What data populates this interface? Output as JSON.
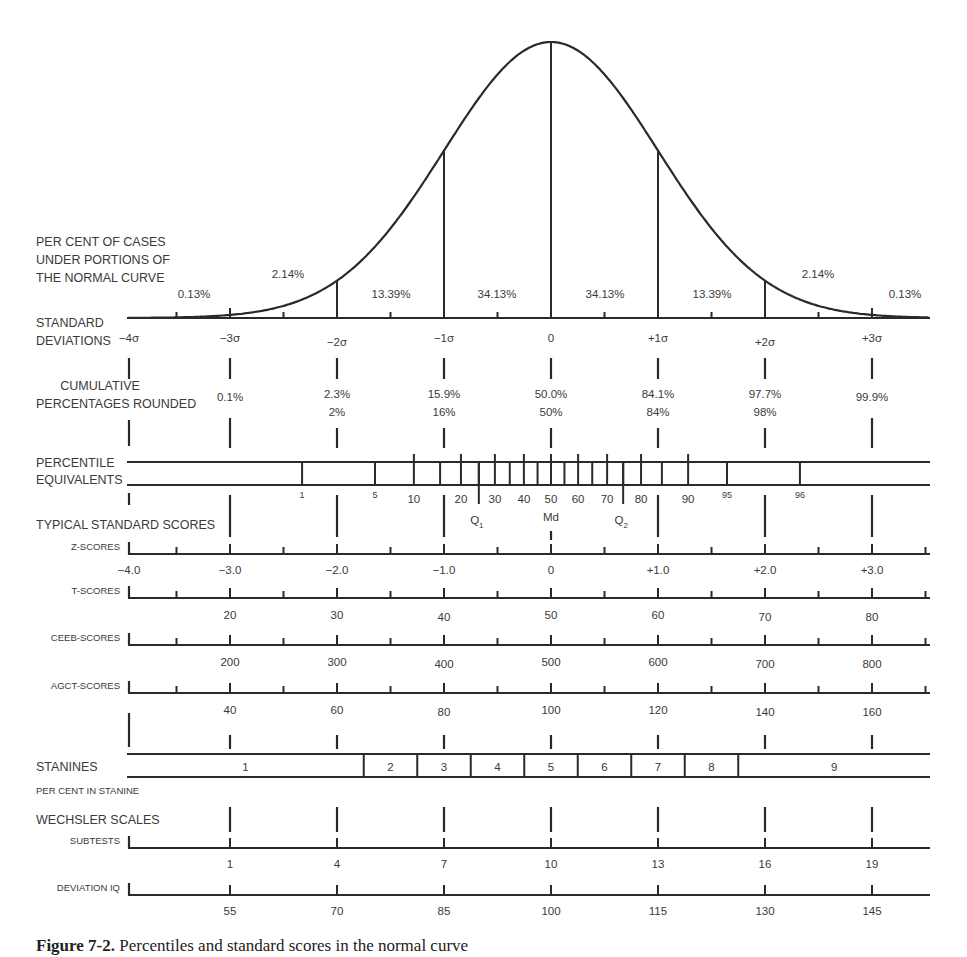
{
  "chart_data": {
    "type": "line",
    "curve": {
      "label_lines": [
        "PER CENT OF CASES",
        "UNDER PORTIONS OF",
        "THE NORMAL CURVE"
      ],
      "segment_percents": [
        "0.13%",
        "2.14%",
        "13.39%",
        "34.13%",
        "34.13%",
        "13.39%",
        "2.14%",
        "0.13%"
      ],
      "x_range_sigma": [
        -4,
        4
      ]
    },
    "standard_deviations": {
      "label_lines": [
        "STANDARD",
        "DEVIATIONS"
      ],
      "ticks": [
        "−4σ",
        "−3σ",
        "−2σ",
        "−1σ",
        "0",
        "+1σ",
        "+2σ",
        "+3σ"
      ],
      "sigma_values": [
        -4,
        -3,
        -2,
        -1,
        0,
        1,
        2,
        3
      ]
    },
    "cumulative_percentages": {
      "label_lines": [
        "CUMULATIVE",
        "PERCENTAGES ROUNDED"
      ],
      "exact": [
        "0.1%",
        "2.3%",
        "15.9%",
        "50.0%",
        "84.1%",
        "97.7%",
        "99.9%"
      ],
      "rounded": [
        "",
        "2%",
        "16%",
        "50%",
        "84%",
        "98%",
        ""
      ]
    },
    "percentile_equivalents": {
      "label_lines": [
        "PERCENTILE",
        "EQUIVALENTS"
      ],
      "ticks": [
        "1",
        "5",
        "10",
        "20",
        "30",
        "40",
        "50",
        "60",
        "70",
        "80",
        "90",
        "95",
        "96"
      ],
      "tick_values": [
        1,
        5,
        10,
        20,
        30,
        40,
        50,
        60,
        70,
        80,
        90,
        95,
        99
      ],
      "quartiles": [
        {
          "label": "Q",
          "sub": "1",
          "percentile": 25
        },
        {
          "label": "Md",
          "sub": "",
          "percentile": 50
        },
        {
          "label": "Q",
          "sub": "2",
          "percentile": 75
        }
      ]
    },
    "typical_standard_scores": {
      "heading": "TYPICAL STANDARD SCORES",
      "scales": [
        {
          "name": "Z-SCORES",
          "values": [
            "−4.0",
            "−3.0",
            "−2.0",
            "−1.0",
            "0",
            "+1.0",
            "+2.0",
            "+3.0"
          ]
        },
        {
          "name": "T-SCORES",
          "values": [
            "",
            "20",
            "30",
            "40",
            "50",
            "60",
            "70",
            "80"
          ]
        },
        {
          "name": "CEEB-SCORES",
          "values": [
            "",
            "200",
            "300",
            "400",
            "500",
            "600",
            "700",
            "800"
          ]
        },
        {
          "name": "AGCT-SCORES",
          "values": [
            "",
            "40",
            "60",
            "80",
            "100",
            "120",
            "140",
            "160"
          ]
        }
      ]
    },
    "stanines": {
      "label": "STANINES",
      "values": [
        "1",
        "2",
        "3",
        "4",
        "5",
        "6",
        "7",
        "8",
        "9"
      ],
      "per_cent_label": "PER CENT IN STANINE",
      "per_cent_values": []
    },
    "wechsler": {
      "heading": "WECHSLER SCALES",
      "subtests": {
        "name": "SUBTESTS",
        "values": [
          "1",
          "4",
          "7",
          "10",
          "13",
          "16",
          "19"
        ]
      },
      "deviation_iq": {
        "name": "DEVIATION IQ",
        "values": [
          "55",
          "70",
          "85",
          "100",
          "115",
          "130",
          "145"
        ]
      }
    }
  },
  "caption": {
    "figure_label": "Figure 7-2.",
    "text": "Percentiles and standard scores in the normal curve"
  },
  "colors": {
    "ink": "#2a2a2a",
    "text": "#3a3a3a",
    "background": "#ffffff"
  }
}
